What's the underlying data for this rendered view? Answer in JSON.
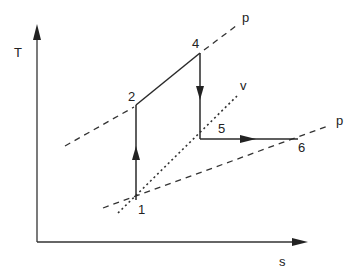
{
  "diagram": {
    "type": "T-s diagram",
    "axes": {
      "y_label": "T",
      "x_label": "s"
    },
    "points": [
      {
        "id": "1",
        "label": "1"
      },
      {
        "id": "2",
        "label": "2"
      },
      {
        "id": "4",
        "label": "4"
      },
      {
        "id": "5",
        "label": "5"
      },
      {
        "id": "6",
        "label": "6"
      }
    ],
    "curves": {
      "upper_pressure_label": "p",
      "volume_label": "v",
      "lower_pressure_label": "p"
    },
    "processes": [
      {
        "from": "1",
        "to": "2",
        "direction": "up"
      },
      {
        "from": "2",
        "to": "4",
        "direction": "diagonal"
      },
      {
        "from": "4",
        "to": "5",
        "direction": "down"
      },
      {
        "from": "5",
        "to": "6",
        "direction": "right"
      }
    ],
    "colors": {
      "line": "#2a2a2a",
      "background": "#ffffff"
    }
  }
}
